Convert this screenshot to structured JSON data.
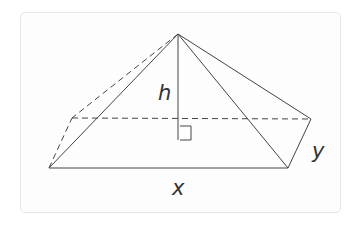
{
  "diagram": {
    "labels": {
      "height": "h",
      "base_length": "x",
      "base_width": "y"
    },
    "vertices": {
      "apex": [
        178,
        34
      ],
      "front_left": [
        49,
        168
      ],
      "front_right": [
        288,
        168
      ],
      "back_right": [
        311,
        119
      ],
      "back_left": [
        72,
        118
      ],
      "height_foot": [
        178,
        140
      ]
    },
    "colors": {
      "line": "#333333",
      "card_border": "#e6e6e6",
      "background": "#fdfdfd"
    }
  }
}
